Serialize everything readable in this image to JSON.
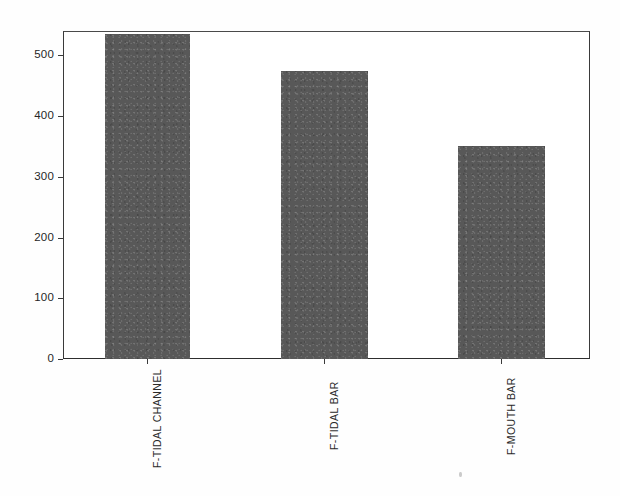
{
  "chart_data": {
    "type": "bar",
    "title": "",
    "subtitle": "",
    "xlabel": "",
    "ylabel": "",
    "categories": [
      "F-TIDAL CHANNEL",
      "F-TIDAL BAR",
      "F-MOUTH BAR"
    ],
    "values": [
      535,
      473,
      350
    ],
    "ylim": [
      0,
      560
    ],
    "yticks": [
      0,
      100,
      200,
      300,
      400,
      500
    ],
    "ytick_labels": [
      "0",
      "100",
      "200",
      "300",
      "400",
      "500"
    ],
    "grid": false,
    "legend": null,
    "legend_position": "none",
    "series": [
      {
        "name": "",
        "values": [
          535,
          473,
          350
        ],
        "color": "#585858"
      }
    ],
    "annotations": []
  },
  "figure": {
    "bar_color": "#585858",
    "axis_color": "#3a3a3a",
    "background_color": "#ffffff",
    "text_color": "#262626"
  }
}
